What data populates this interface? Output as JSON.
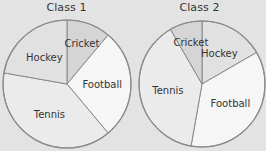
{
  "chart_data": [
    {
      "type": "pie",
      "title": "Class 1",
      "start_angle_deg": 0,
      "direction": "clockwise",
      "slices": [
        {
          "label": "Cricket",
          "angle_deg": 40,
          "percent": 11.1,
          "color": "#d5d5d5"
        },
        {
          "label": "Football",
          "angle_deg": 100,
          "percent": 27.8,
          "color": "#f6f6f6"
        },
        {
          "label": "Tennis",
          "angle_deg": 140,
          "percent": 38.9,
          "color": "#ebebeb"
        },
        {
          "label": "Hockey",
          "angle_deg": 80,
          "percent": 22.2,
          "color": "#e1e1e1"
        }
      ]
    },
    {
      "type": "pie",
      "title": "Class 2",
      "start_angle_deg": 0,
      "direction": "clockwise",
      "slices": [
        {
          "label": "Hockey",
          "angle_deg": 60,
          "percent": 16.7,
          "color": "#e1e1e1"
        },
        {
          "label": "Football",
          "angle_deg": 130,
          "percent": 36.1,
          "color": "#f6f6f6"
        },
        {
          "label": "Tennis",
          "angle_deg": 140,
          "percent": 38.9,
          "color": "#ebebeb"
        },
        {
          "label": "Cricket",
          "angle_deg": 30,
          "percent": 8.3,
          "color": "#d5d5d5"
        }
      ]
    }
  ],
  "style": {
    "background": "#e3e3e3",
    "stroke": "#8a8a8a"
  }
}
